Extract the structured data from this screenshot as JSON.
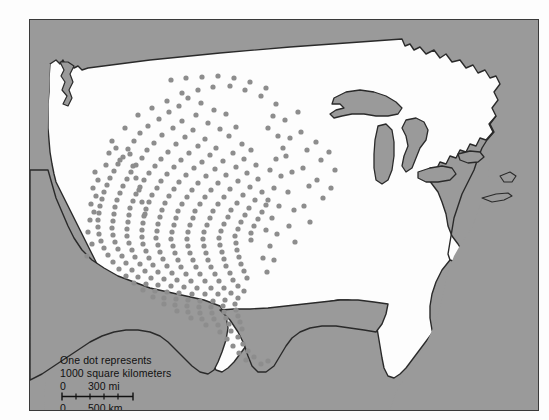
{
  "map": {
    "title": "Dot density map of the United States",
    "colors": {
      "surround": "#9a9a9a",
      "land": "#fdfdfd",
      "lakes": "#9a9a9a",
      "dot": "#8d8d8d",
      "outline": "#2a2a2a",
      "frame": "#3a3a3a",
      "text": "#111111"
    },
    "legend": {
      "line1": "One dot represents",
      "line2": "1000 square kilometers"
    },
    "scale": {
      "miles": {
        "zero": "0",
        "value": "300 mi"
      },
      "kilometers": {
        "zero": "0",
        "value": "500 km"
      }
    }
  },
  "chart_data": {
    "type": "scatter",
    "title": "One dot represents 1000 square kilometers",
    "xlabel": "",
    "ylabel": "",
    "legend_entries": [
      "One dot represents 1000 square kilometers"
    ],
    "annotations": [
      "0  300 mi",
      "0  500 km"
    ],
    "dot_value": 1000,
    "dot_unit": "square kilometers",
    "dots": [
      [
        158,
        78
      ],
      [
        171,
        83
      ],
      [
        149,
        86
      ],
      [
        184,
        90
      ],
      [
        139,
        92
      ],
      [
        166,
        95
      ],
      [
        196,
        94
      ],
      [
        129,
        99
      ],
      [
        152,
        101
      ],
      [
        178,
        103
      ],
      [
        118,
        106
      ],
      [
        143,
        108
      ],
      [
        163,
        110
      ],
      [
        190,
        109
      ],
      [
        206,
        107
      ],
      [
        110,
        113
      ],
      [
        132,
        115
      ],
      [
        155,
        117
      ],
      [
        175,
        119
      ],
      [
        199,
        116
      ],
      [
        104,
        121
      ],
      [
        124,
        123
      ],
      [
        146,
        124
      ],
      [
        168,
        126
      ],
      [
        186,
        128
      ],
      [
        212,
        124
      ],
      [
        98,
        129
      ],
      [
        117,
        130
      ],
      [
        138,
        132
      ],
      [
        159,
        133
      ],
      [
        180,
        135
      ],
      [
        203,
        133
      ],
      [
        221,
        130
      ],
      [
        93,
        137
      ],
      [
        112,
        138
      ],
      [
        131,
        139
      ],
      [
        151,
        140
      ],
      [
        172,
        142
      ],
      [
        193,
        141
      ],
      [
        214,
        139
      ],
      [
        88,
        144
      ],
      [
        106,
        145
      ],
      [
        125,
        146
      ],
      [
        144,
        147
      ],
      [
        164,
        148
      ],
      [
        185,
        149
      ],
      [
        206,
        147
      ],
      [
        226,
        145
      ],
      [
        84,
        151
      ],
      [
        101,
        152
      ],
      [
        119,
        153
      ],
      [
        137,
        154
      ],
      [
        156,
        155
      ],
      [
        176,
        156
      ],
      [
        196,
        155
      ],
      [
        217,
        153
      ],
      [
        80,
        158
      ],
      [
        97,
        159
      ],
      [
        114,
        160
      ],
      [
        131,
        161
      ],
      [
        149,
        162
      ],
      [
        168,
        163
      ],
      [
        188,
        163
      ],
      [
        208,
        161
      ],
      [
        228,
        159
      ],
      [
        77,
        165
      ],
      [
        93,
        166
      ],
      [
        110,
        167
      ],
      [
        127,
        168
      ],
      [
        144,
        169
      ],
      [
        162,
        170
      ],
      [
        181,
        170
      ],
      [
        200,
        169
      ],
      [
        220,
        167
      ],
      [
        74,
        172
      ],
      [
        90,
        173
      ],
      [
        106,
        174
      ],
      [
        122,
        175
      ],
      [
        139,
        176
      ],
      [
        157,
        177
      ],
      [
        175,
        177
      ],
      [
        194,
        177
      ],
      [
        213,
        175
      ],
      [
        232,
        172
      ],
      [
        72,
        179
      ],
      [
        87,
        180
      ],
      [
        103,
        181
      ],
      [
        119,
        182
      ],
      [
        135,
        183
      ],
      [
        152,
        184
      ],
      [
        170,
        184
      ],
      [
        188,
        184
      ],
      [
        207,
        183
      ],
      [
        225,
        180
      ],
      [
        70,
        186
      ],
      [
        85,
        187
      ],
      [
        100,
        188
      ],
      [
        116,
        189
      ],
      [
        132,
        190
      ],
      [
        148,
        191
      ],
      [
        165,
        191
      ],
      [
        183,
        191
      ],
      [
        201,
        190
      ],
      [
        219,
        188
      ],
      [
        236,
        185
      ],
      [
        69,
        193
      ],
      [
        84,
        194
      ],
      [
        99,
        195
      ],
      [
        114,
        196
      ],
      [
        130,
        197
      ],
      [
        146,
        198
      ],
      [
        163,
        198
      ],
      [
        180,
        198
      ],
      [
        198,
        197
      ],
      [
        215,
        195
      ],
      [
        232,
        192
      ],
      [
        68,
        200
      ],
      [
        83,
        201
      ],
      [
        98,
        202
      ],
      [
        113,
        203
      ],
      [
        128,
        204
      ],
      [
        144,
        205
      ],
      [
        160,
        205
      ],
      [
        177,
        205
      ],
      [
        194,
        204
      ],
      [
        211,
        202
      ],
      [
        228,
        199
      ],
      [
        68,
        207
      ],
      [
        82,
        208
      ],
      [
        97,
        209
      ],
      [
        112,
        210
      ],
      [
        127,
        211
      ],
      [
        142,
        212
      ],
      [
        158,
        212
      ],
      [
        174,
        212
      ],
      [
        191,
        211
      ],
      [
        208,
        209
      ],
      [
        224,
        206
      ],
      [
        69,
        214
      ],
      [
        83,
        215
      ],
      [
        97,
        216
      ],
      [
        112,
        217
      ],
      [
        126,
        218
      ],
      [
        141,
        219
      ],
      [
        157,
        219
      ],
      [
        173,
        219
      ],
      [
        189,
        218
      ],
      [
        205,
        216
      ],
      [
        221,
        213
      ],
      [
        71,
        221
      ],
      [
        85,
        222
      ],
      [
        99,
        223
      ],
      [
        113,
        224
      ],
      [
        128,
        225
      ],
      [
        143,
        226
      ],
      [
        158,
        226
      ],
      [
        174,
        226
      ],
      [
        190,
        225
      ],
      [
        206,
        223
      ],
      [
        221,
        220
      ],
      [
        74,
        228
      ],
      [
        88,
        229
      ],
      [
        102,
        230
      ],
      [
        116,
        231
      ],
      [
        130,
        232
      ],
      [
        145,
        233
      ],
      [
        160,
        233
      ],
      [
        176,
        233
      ],
      [
        192,
        232
      ],
      [
        207,
        230
      ],
      [
        78,
        235
      ],
      [
        92,
        236
      ],
      [
        105,
        237
      ],
      [
        119,
        238
      ],
      [
        133,
        239
      ],
      [
        148,
        240
      ],
      [
        163,
        240
      ],
      [
        178,
        240
      ],
      [
        194,
        239
      ],
      [
        209,
        237
      ],
      [
        83,
        242
      ],
      [
        96,
        243
      ],
      [
        110,
        244
      ],
      [
        123,
        245
      ],
      [
        137,
        246
      ],
      [
        151,
        247
      ],
      [
        166,
        247
      ],
      [
        181,
        247
      ],
      [
        196,
        246
      ],
      [
        211,
        244
      ],
      [
        89,
        249
      ],
      [
        102,
        250
      ],
      [
        115,
        251
      ],
      [
        128,
        252
      ],
      [
        142,
        253
      ],
      [
        156,
        254
      ],
      [
        170,
        254
      ],
      [
        185,
        254
      ],
      [
        200,
        253
      ],
      [
        214,
        251
      ],
      [
        96,
        256
      ],
      [
        108,
        257
      ],
      [
        121,
        258
      ],
      [
        134,
        259
      ],
      [
        147,
        260
      ],
      [
        161,
        261
      ],
      [
        175,
        261
      ],
      [
        189,
        261
      ],
      [
        203,
        260
      ],
      [
        217,
        258
      ],
      [
        104,
        263
      ],
      [
        116,
        264
      ],
      [
        128,
        265
      ],
      [
        141,
        266
      ],
      [
        154,
        267
      ],
      [
        167,
        268
      ],
      [
        181,
        268
      ],
      [
        194,
        268
      ],
      [
        208,
        266
      ],
      [
        113,
        270
      ],
      [
        125,
        271
      ],
      [
        137,
        272
      ],
      [
        149,
        273
      ],
      [
        162,
        274
      ],
      [
        175,
        274
      ],
      [
        188,
        274
      ],
      [
        201,
        273
      ],
      [
        214,
        271
      ],
      [
        123,
        277
      ],
      [
        134,
        278
      ],
      [
        146,
        279
      ],
      [
        158,
        280
      ],
      [
        170,
        281
      ],
      [
        183,
        281
      ],
      [
        195,
        280
      ],
      [
        208,
        278
      ],
      [
        134,
        284
      ],
      [
        145,
        285
      ],
      [
        157,
        286
      ],
      [
        169,
        287
      ],
      [
        181,
        287
      ],
      [
        193,
        286
      ],
      [
        205,
        284
      ],
      [
        147,
        291
      ],
      [
        158,
        292
      ],
      [
        170,
        293
      ],
      [
        182,
        293
      ],
      [
        194,
        292
      ],
      [
        206,
        290
      ],
      [
        161,
        298
      ],
      [
        172,
        299
      ],
      [
        184,
        299
      ],
      [
        196,
        298
      ],
      [
        208,
        296
      ],
      [
        176,
        305
      ],
      [
        188,
        305
      ],
      [
        199,
        304
      ],
      [
        210,
        302
      ],
      [
        190,
        312
      ],
      [
        201,
        311
      ],
      [
        212,
        309
      ],
      [
        197,
        319
      ],
      [
        208,
        317
      ],
      [
        203,
        326
      ],
      [
        213,
        324
      ],
      [
        209,
        333
      ],
      [
        218,
        331
      ],
      [
        216,
        340
      ],
      [
        224,
        337
      ],
      [
        231,
        344
      ],
      [
        238,
        341
      ],
      [
        95,
        108
      ],
      [
        108,
        95
      ],
      [
        122,
        88
      ],
      [
        137,
        81
      ],
      [
        152,
        73
      ],
      [
        168,
        70
      ],
      [
        183,
        67
      ],
      [
        200,
        66
      ],
      [
        215,
        70
      ],
      [
        231,
        76
      ],
      [
        246,
        84
      ],
      [
        243,
        96
      ],
      [
        238,
        108
      ],
      [
        248,
        116
      ],
      [
        253,
        128
      ],
      [
        246,
        139
      ],
      [
        240,
        150
      ],
      [
        251,
        156
      ],
      [
        244,
        168
      ],
      [
        238,
        180
      ],
      [
        249,
        186
      ],
      [
        242,
        198
      ],
      [
        236,
        210
      ],
      [
        247,
        214
      ],
      [
        240,
        226
      ],
      [
        233,
        238
      ],
      [
        244,
        240
      ],
      [
        237,
        252
      ],
      [
        60,
        200
      ],
      [
        58,
        212
      ],
      [
        62,
        224
      ],
      [
        57,
        236
      ],
      [
        64,
        192
      ],
      [
        61,
        184
      ],
      [
        66,
        176
      ],
      [
        63,
        168
      ],
      [
        68,
        160
      ],
      [
        65,
        152
      ],
      [
        255,
        100
      ],
      [
        260,
        118
      ],
      [
        256,
        136
      ],
      [
        262,
        152
      ],
      [
        258,
        172
      ],
      [
        264,
        190
      ],
      [
        259,
        206
      ],
      [
        265,
        222
      ],
      [
        271,
        112
      ],
      [
        277,
        130
      ],
      [
        273,
        148
      ],
      [
        279,
        166
      ],
      [
        274,
        186
      ],
      [
        280,
        202
      ],
      [
        268,
        92
      ],
      [
        286,
        122
      ],
      [
        291,
        140
      ],
      [
        287,
        160
      ],
      [
        293,
        178
      ],
      [
        299,
        132
      ],
      [
        305,
        150
      ],
      [
        301,
        168
      ],
      [
        141,
        60
      ],
      [
        156,
        58
      ],
      [
        172,
        57
      ],
      [
        188,
        56
      ],
      [
        204,
        58
      ],
      [
        220,
        62
      ],
      [
        236,
        68
      ],
      [
        100,
        134
      ],
      [
        103,
        146
      ],
      [
        106,
        158
      ],
      [
        109,
        170
      ],
      [
        112,
        182
      ],
      [
        115,
        194
      ],
      [
        76,
        145
      ],
      [
        79,
        133
      ],
      [
        82,
        121
      ],
      [
        86,
        128
      ],
      [
        90,
        140
      ]
    ]
  }
}
